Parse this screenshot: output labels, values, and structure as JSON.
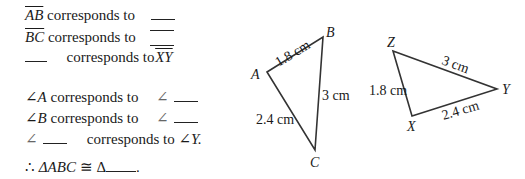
{
  "statements": {
    "segments": [
      {
        "left": "AB",
        "middle": "corresponds to",
        "right": "___"
      },
      {
        "left": "BC",
        "middle": "corresponds to",
        "right": "___"
      },
      {
        "left": "___",
        "middle": "corresponds to",
        "right": "XY"
      }
    ],
    "angles": [
      {
        "left": "∠A",
        "middle": "corresponds to",
        "right_prefix": "∠",
        "right": "___"
      },
      {
        "left": "∠B",
        "middle": "corresponds to",
        "right_prefix": "∠",
        "right": "___"
      },
      {
        "left_prefix": "∠",
        "left": "___",
        "middle": "corresponds to",
        "right": "∠Y."
      }
    ],
    "conclusion": {
      "therefore": "∴",
      "lhs": "ΔABC",
      "congruent": "≅",
      "rhs_prefix": "Δ",
      "rhs": "___",
      "end": "."
    }
  },
  "triangle_abc": {
    "vertices": {
      "A": "A",
      "B": "B",
      "C": "C"
    },
    "sides": {
      "AB": "1.8 cm",
      "BC": "3 cm",
      "AC": "2.4 cm"
    }
  },
  "triangle_xyz": {
    "vertices": {
      "X": "X",
      "Y": "Y",
      "Z": "Z"
    },
    "sides": {
      "ZX": "1.8 cm",
      "ZY": "3 cm",
      "XY": "2.4 cm"
    }
  }
}
